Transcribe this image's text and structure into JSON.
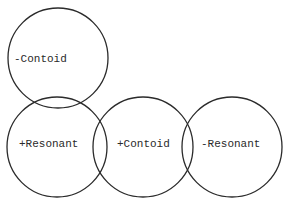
{
  "diagram": {
    "type": "venn-style feature circles",
    "stroke_color": "#2b2b2b",
    "background": "#ffffff",
    "circles": [
      {
        "id": "minus-contoid",
        "label": "-Contoid",
        "cx": 58,
        "cy": 58,
        "r": 50
      },
      {
        "id": "plus-resonant",
        "label": "+Resonant",
        "cx": 57,
        "cy": 147,
        "r": 50
      },
      {
        "id": "plus-contoid",
        "label": "+Contoid",
        "cx": 143,
        "cy": 147,
        "r": 50
      },
      {
        "id": "minus-resonant",
        "label": "-Resonant",
        "cx": 232,
        "cy": 147,
        "r": 50
      }
    ]
  }
}
